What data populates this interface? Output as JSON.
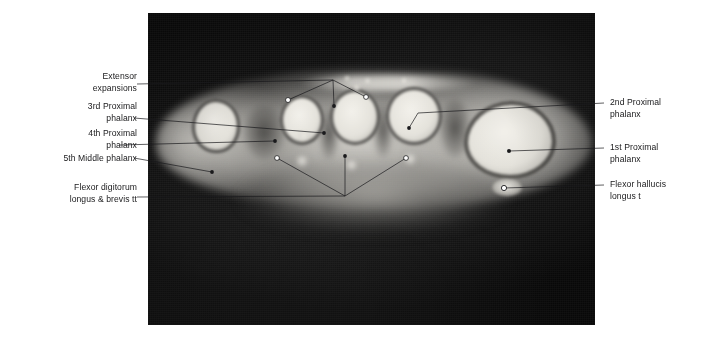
{
  "figure": {
    "modality": "MRI",
    "panel": {
      "left": 148,
      "top": 13,
      "width": 447,
      "height": 312,
      "background_color": "#0c0c0c"
    },
    "line_color": "#1a1a1c",
    "text_color": "#19191b"
  },
  "labels": {
    "left": [
      {
        "id": "extensor-expansions",
        "lines": [
          "Extensor",
          "expansions"
        ],
        "align": "right"
      },
      {
        "id": "3rd-proximal-phalanx",
        "lines": [
          "3rd Proximal",
          "phalanx"
        ],
        "align": "right"
      },
      {
        "id": "4th-proximal-phalanx",
        "lines": [
          "4th Proximal",
          "phalanx"
        ],
        "align": "right"
      },
      {
        "id": "5th-middle-phalanx",
        "lines": [
          "5th Middle phalanx"
        ],
        "align": "right"
      },
      {
        "id": "flexor-digitorum-longus-brevis-tt",
        "lines": [
          "Flexor digitorum",
          "longus & brevis tt"
        ],
        "align": "right"
      }
    ],
    "right": [
      {
        "id": "2nd-proximal-phalanx",
        "lines": [
          "2nd Proximal",
          "phalanx"
        ],
        "align": "left"
      },
      {
        "id": "1st-proximal-phalanx",
        "lines": [
          "1st Proximal",
          "phalanx"
        ],
        "align": "left"
      },
      {
        "id": "flexor-hallucis-longus-t",
        "lines": [
          "Flexor hallucis",
          "longus t"
        ],
        "align": "left"
      }
    ]
  },
  "anatomy_markers": [
    {
      "id": "extensor-expansions",
      "marker_points": [
        [
          288,
          104
        ],
        [
          461,
          72
        ],
        [
          658,
          51
        ]
      ],
      "marker_style": "open-circle-and-dots"
    },
    {
      "id": "3rd-proximal-phalanx",
      "marker_points": [
        [
          472,
          143
        ]
      ],
      "marker_style": "dot"
    },
    {
      "id": "4th-proximal-phalanx",
      "marker_points": [
        [
          285,
          167
        ]
      ],
      "marker_style": "dot"
    },
    {
      "id": "5th-middle-phalanx",
      "marker_points": [
        [
          95,
          199
        ]
      ],
      "marker_style": "dot"
    },
    {
      "id": "flexor-digitorum-longus-brevis-tt",
      "marker_points": [
        [
          291,
          220
        ],
        [
          490,
          233
        ],
        [
          677,
          231
        ]
      ],
      "marker_style": "open-circle-and-dots"
    },
    {
      "id": "2nd-proximal-phalanx",
      "marker_points": [
        [
          687,
          150
        ]
      ],
      "marker_style": "dot"
    },
    {
      "id": "1st-proximal-phalanx",
      "marker_points": [
        [
          986,
          191
        ]
      ],
      "marker_style": "dot"
    },
    {
      "id": "flexor-hallucis-longus-t",
      "marker_points": [
        [
          966,
          303
        ]
      ],
      "marker_style": "open-circle"
    }
  ]
}
